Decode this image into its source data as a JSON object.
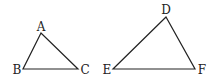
{
  "figure": {
    "line_color": "#222222",
    "triangles": [
      {
        "name": "ABC",
        "vertices": [
          {
            "label": "A",
            "x": 41,
            "y": 33,
            "lx": 41,
            "ly": 31
          },
          {
            "label": "B",
            "x": 23,
            "y": 69,
            "lx": 17,
            "ly": 74
          },
          {
            "label": "C",
            "x": 78,
            "y": 69,
            "lx": 85,
            "ly": 74
          }
        ]
      },
      {
        "name": "DEF",
        "vertices": [
          {
            "label": "D",
            "x": 166,
            "y": 17,
            "lx": 166,
            "ly": 14
          },
          {
            "label": "E",
            "x": 113,
            "y": 69,
            "lx": 107,
            "ly": 74
          },
          {
            "label": "F",
            "x": 195,
            "y": 69,
            "lx": 202,
            "ly": 74
          }
        ]
      }
    ]
  }
}
